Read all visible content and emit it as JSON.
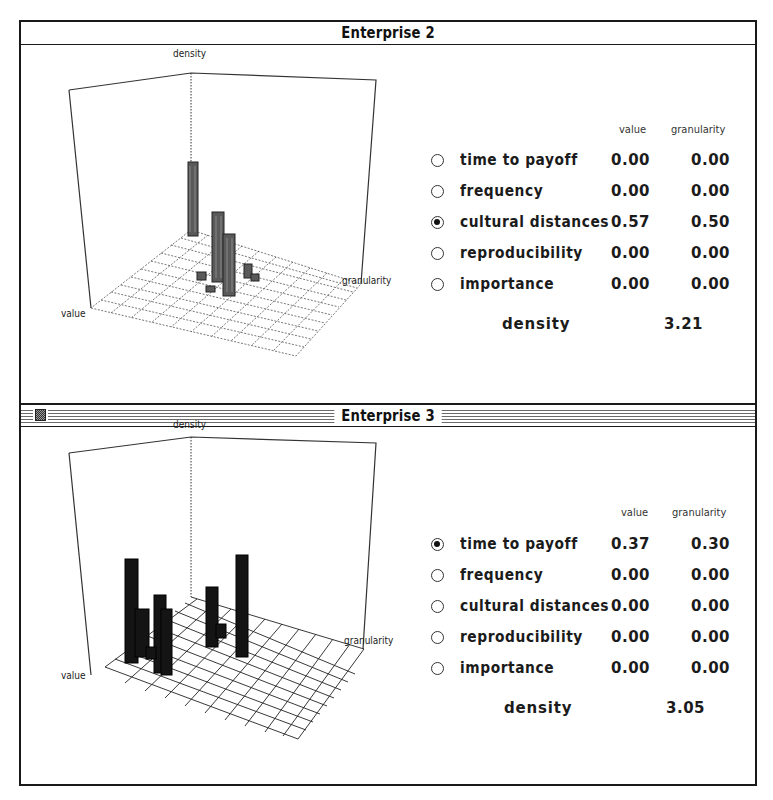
{
  "windows": [
    {
      "title": "Enterprise 2",
      "active": false,
      "chart": {
        "density_label": "density",
        "value_label": "value",
        "granularity_label": "granularity"
      },
      "columns": {
        "value": "value",
        "granularity": "granularity"
      },
      "rows": [
        {
          "label": "time to payoff",
          "value": "0.00",
          "granularity": "0.00",
          "selected": false
        },
        {
          "label": "frequency",
          "value": "0.00",
          "granularity": "0.00",
          "selected": false
        },
        {
          "label": "cultural distances",
          "value": "0.57",
          "granularity": "0.50",
          "selected": true
        },
        {
          "label": "reproducibility",
          "value": "0.00",
          "granularity": "0.00",
          "selected": false
        },
        {
          "label": "importance",
          "value": "0.00",
          "granularity": "0.00",
          "selected": false
        }
      ],
      "density": {
        "label": "density",
        "value": "3.21"
      }
    },
    {
      "title": "Enterprise 3",
      "active": true,
      "chart": {
        "density_label": "density",
        "value_label": "value",
        "granularity_label": "granularity"
      },
      "columns": {
        "value": "value",
        "granularity": "granularity"
      },
      "rows": [
        {
          "label": "time to payoff",
          "value": "0.37",
          "granularity": "0.30",
          "selected": true
        },
        {
          "label": "frequency",
          "value": "0.00",
          "granularity": "0.00",
          "selected": false
        },
        {
          "label": "cultural distances",
          "value": "0.00",
          "granularity": "0.00",
          "selected": false
        },
        {
          "label": "reproducibility",
          "value": "0.00",
          "granularity": "0.00",
          "selected": false
        },
        {
          "label": "importance",
          "value": "0.00",
          "granularity": "0.00",
          "selected": false
        }
      ],
      "density": {
        "label": "density",
        "value": "3.05"
      }
    }
  ],
  "colors": {
    "border": "#1a1a1a",
    "bar_top_window": "#5a5a5a",
    "bar_bottom_window": "#141414",
    "grid": "#444444"
  }
}
